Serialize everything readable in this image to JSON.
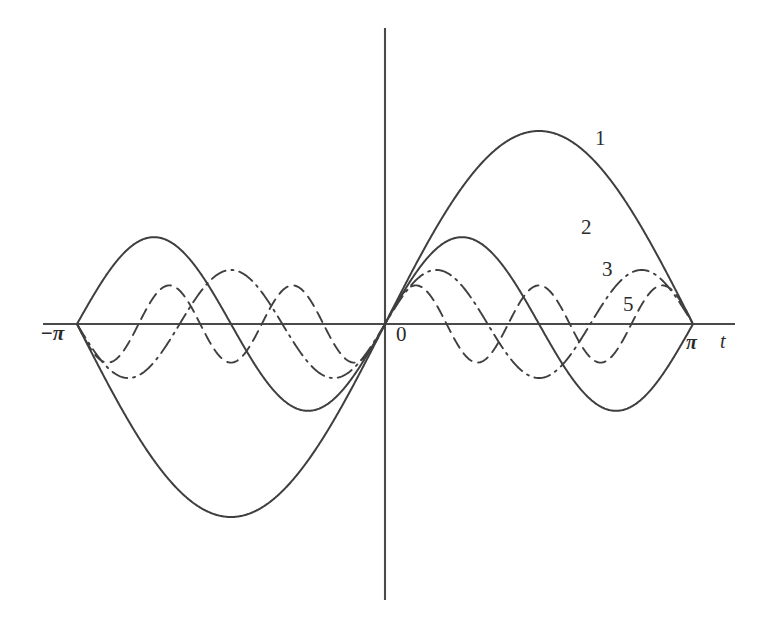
{
  "figure": {
    "background_color": "#ffffff",
    "ink_color": "#3f3f3f"
  },
  "axes": {
    "x_axis_name": "t",
    "x_axis_label": "t",
    "origin_label": "0",
    "left_tick_label": "−π",
    "right_tick_label": "π",
    "x_range_label": "[−π, π]",
    "y_axis_label": ""
  },
  "curve_labels": {
    "c1": "1",
    "c2": "2",
    "c3": "3",
    "c5": "5"
  },
  "chart_data": {
    "type": "line",
    "title": "",
    "subtitle": "",
    "xlabel": "t",
    "ylabel": "",
    "xlim": [
      -3.141592653589793,
      3.141592653589793
    ],
    "ylim": [
      -1.05,
      1.05
    ],
    "xticks": [
      -3.141592653589793,
      0,
      3.141592653589793
    ],
    "xticklabels": [
      "−π",
      "0",
      "π"
    ],
    "yticks": [],
    "yticklabels": [],
    "grid": false,
    "legend_position": "inline-curve-labels",
    "annotations": [
      {
        "text": "1",
        "x": 2.05,
        "y": 0.86,
        "target_series": "1"
      },
      {
        "text": "2",
        "x": 1.93,
        "y": 0.43,
        "target_series": "2"
      },
      {
        "text": "3",
        "x": 2.14,
        "y": 0.25,
        "target_series": "3"
      },
      {
        "text": "5",
        "x": 2.35,
        "y": 0.08,
        "target_series": "5"
      }
    ],
    "series": [
      {
        "name": "1",
        "label": "1",
        "formula": "sin(t)",
        "harmonic": 1,
        "amplitude": 1.0,
        "period": 6.283185307179586,
        "linestyle": "solid",
        "color": "#3f3f3f",
        "peak": {
          "x": 1.5707963,
          "y": 1.0
        },
        "trough": {
          "x": -1.5707963,
          "y": -1.0
        },
        "zero_crossings": [
          -3.141592653589793,
          0,
          3.141592653589793
        ]
      },
      {
        "name": "2",
        "label": "2",
        "formula": "sin(2t)/2",
        "harmonic": 2,
        "amplitude": 0.45,
        "period": 3.141592653589793,
        "linestyle": "solid",
        "color": "#3f3f3f",
        "peak": {
          "x": 0.7853982,
          "y": 0.45
        },
        "trough": {
          "x": -0.7853982,
          "y": -0.45
        },
        "zero_crossings": [
          -3.141592653589793,
          -1.5707963,
          0,
          1.5707963,
          3.141592653589793
        ]
      },
      {
        "name": "3",
        "label": "3",
        "formula": "sin(3t)/3",
        "harmonic": 3,
        "amplitude": 0.28,
        "period": 2.0943951,
        "linestyle": "dashdot",
        "color": "#3f3f3f",
        "peak": {
          "x": 0.5235988,
          "y": 0.28
        },
        "trough": {
          "x": -0.5235988,
          "y": -0.28
        },
        "zero_crossings": [
          -3.141592653589793,
          -2.0943951,
          -1.0471976,
          0,
          1.0471976,
          2.0943951,
          3.141592653589793
        ]
      },
      {
        "name": "5",
        "label": "5",
        "formula": "sin(5t)/5",
        "harmonic": 5,
        "amplitude": 0.2,
        "period": 1.2566371,
        "linestyle": "dashed",
        "color": "#3f3f3f",
        "peak": {
          "x": 0.3141593,
          "y": 0.2
        },
        "trough": {
          "x": -0.3141593,
          "y": -0.2
        },
        "zero_crossings": [
          -3.141592653589793,
          -2.5132741,
          -1.8849556,
          -1.2566371,
          -0.6283185,
          0,
          0.6283185,
          1.2566371,
          1.8849556,
          2.5132741,
          3.141592653589793
        ]
      }
    ]
  },
  "geometry": {
    "origin_px": [
      385,
      324
    ],
    "pi_px": 308,
    "unit_amplitude_px": 193,
    "x_axis_start_px": 43,
    "x_axis_end_px": 735,
    "y_axis_top_px": 28,
    "y_axis_bottom_px": 600
  }
}
